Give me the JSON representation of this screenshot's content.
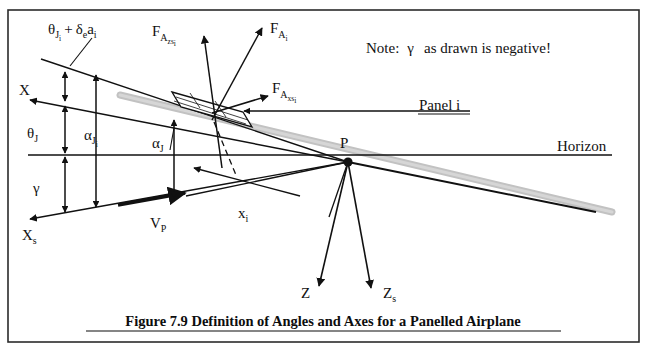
{
  "figure": {
    "caption": "Figure 7.9 Definition of Angles and Axes for a Panelled Airplane",
    "note": {
      "prefix": "Note:",
      "symbol": "γ",
      "text": "as drawn is negative!"
    },
    "border_color": "#2b2b2b",
    "line_color": "#111111",
    "body_color": "#bfbfbf"
  },
  "labels": {
    "theta_Ji_plus": {
      "main": "θ",
      "sub": "J",
      "sub2": "i",
      "plus": "+",
      "delta": "δ",
      "delta_sub": "e",
      "a": "a",
      "a_sub": "i"
    },
    "X": "X",
    "Xs_main": "X",
    "Xs_sub": "s",
    "theta_J_main": "θ",
    "theta_J_sub": "J",
    "alpha_Ji_main": "α",
    "alpha_Ji_sub": "J",
    "alpha_Ji_sub2": "i",
    "alpha_J_main": "α",
    "alpha_J_sub": "J",
    "gamma": "γ",
    "VP_main": "V",
    "VP_sub": "P",
    "xi_main": "x",
    "xi_sub": "i",
    "P": "P",
    "Z": "Z",
    "Zs_main": "Z",
    "Zs_sub": "s",
    "panel_i": "Panel i",
    "horizon": "Horizon",
    "FAzsi_main": "F",
    "FAzsi_sub": "A",
    "FAzsi_sub2": "zs",
    "FAzsi_sub3": "i",
    "FAi_main": "F",
    "FAi_sub": "A",
    "FAi_sub2": "i",
    "FAxsi_main": "F",
    "FAxsi_sub": "A",
    "FAxsi_sub2": "xs",
    "FAxsi_sub3": "i"
  }
}
